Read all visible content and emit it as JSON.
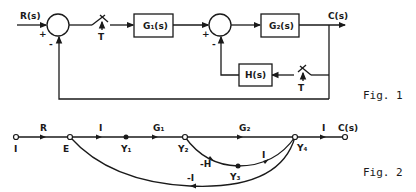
{
  "figure1": {
    "caption": "Fig. 1",
    "input_label": "R(s)",
    "output_label": "C(s)",
    "summer1": {
      "plus": "+",
      "minus": "-"
    },
    "summer2": {
      "plus": "+",
      "minus": "-"
    },
    "switch1_label": "T",
    "switch2_label": "T",
    "blocks": {
      "g1": "G₁(s)",
      "g2": "G₂(s)",
      "h": "H(s)"
    }
  },
  "figure2": {
    "caption": "Fig. 2",
    "nodes": {
      "input": "I",
      "e": "E",
      "y1": "Y₁",
      "y2": "Y₂",
      "y3": "Y₃",
      "y4": "Y₄",
      "output": "C(s)"
    },
    "branch_gains": {
      "input_to_e": "R",
      "e_to_y1": "I",
      "y1_to_y2": "G₁",
      "y2_to_y4": "G₂",
      "y4_to_output": "I",
      "y2_to_y3": "-H",
      "y3_to_y4": "I",
      "y4_to_e": "-I"
    }
  }
}
